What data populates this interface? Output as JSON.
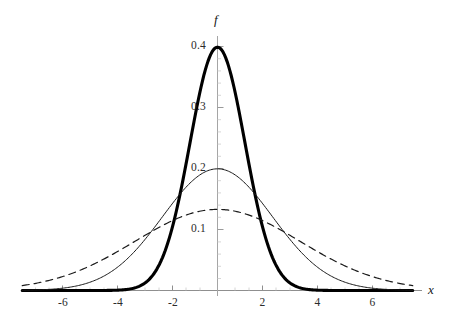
{
  "chart_data": {
    "type": "line",
    "title": "",
    "subtitle": "",
    "xlabel": "x",
    "ylabel": "f",
    "xlim": [
      -7.1,
      7.1
    ],
    "ylim": [
      0,
      0.425
    ],
    "grid": false,
    "legend": "none",
    "x_ticks": [
      -6,
      -4,
      -2,
      2,
      4,
      6
    ],
    "x_tick_labels": [
      "-6",
      "-4",
      "-2",
      "2",
      "4",
      "6"
    ],
    "y_ticks": [
      0.1,
      0.2,
      0.3,
      0.4
    ],
    "y_tick_labels": [
      "0.1",
      "0.2",
      "0.3",
      "0.4"
    ],
    "x": [
      -7,
      -6.5,
      -6,
      -5.5,
      -5,
      -4.5,
      -4,
      -3.5,
      -3,
      -2.5,
      -2,
      -1.5,
      -1,
      -0.5,
      0,
      0.5,
      1,
      1.5,
      2,
      2.5,
      3,
      3.5,
      4,
      4.5,
      5,
      5.5,
      6,
      6.5,
      7
    ],
    "series": [
      {
        "name": "sigma-1",
        "mu": 0,
        "sigma": 1,
        "peak": 0.3989,
        "style": "solid",
        "line_width": 3.1,
        "color": "#000000",
        "values": [
          0.0,
          0.0,
          0.0,
          0.0,
          0.0,
          0.0,
          0.0001,
          0.0009,
          0.0044,
          0.0175,
          0.054,
          0.1295,
          0.242,
          0.3521,
          0.3989,
          0.3521,
          0.242,
          0.1295,
          0.054,
          0.0175,
          0.0044,
          0.0009,
          0.0001,
          0.0,
          0.0,
          0.0,
          0.0,
          0.0,
          0.0
        ]
      },
      {
        "name": "sigma-2",
        "mu": 0,
        "sigma": 2,
        "peak": 0.1995,
        "style": "solid",
        "line_width": 1.0,
        "color": "#1a1a1a",
        "values": [
          0.0018,
          0.0034,
          0.0065,
          0.0114,
          0.0088,
          0.0145,
          0.027,
          0.041,
          0.0648,
          0.0912,
          0.121,
          0.1509,
          0.176,
          0.1933,
          0.1995,
          0.1933,
          0.176,
          0.1509,
          0.121,
          0.0912,
          0.0648,
          0.041,
          0.027,
          0.0145,
          0.0088,
          0.0034,
          0.0065,
          0.0034,
          0.0018
        ]
      },
      {
        "name": "sigma-3",
        "mu": 0,
        "sigma": 3,
        "peak": 0.133,
        "style": "dashed",
        "line_width": 1.2,
        "color": "#1a1a1a",
        "values": [
          0.0086,
          0.0121,
          0.018,
          0.0246,
          0.0324,
          0.0411,
          0.0504,
          0.06,
          0.0697,
          0.079,
          0.0876,
          0.095,
          0.1009,
          0.105,
          0.133,
          0.105,
          0.1009,
          0.095,
          0.0876,
          0.079,
          0.0697,
          0.06,
          0.0504,
          0.0411,
          0.0324,
          0.0246,
          0.018,
          0.0121,
          0.0086
        ]
      }
    ],
    "annotations": []
  },
  "axes": {
    "x_axis_label": "x",
    "y_axis_label": "f"
  },
  "colors": {
    "axis": "#8c8c8c",
    "curve_primary": "#000000",
    "curve_secondary": "#1a1a1a",
    "background": "#ffffff",
    "tick_text": "#2b2b2b"
  }
}
